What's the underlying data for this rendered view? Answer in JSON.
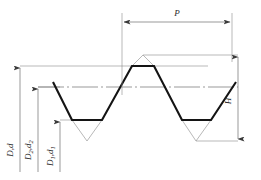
{
  "drawing": {
    "title": "ISO metric screw thread profile",
    "colors": {
      "profile_line": "#1a1a1a",
      "construction_line": "#8c8c8c",
      "dimension_line": "#6e6e6e",
      "text": "#2b2b2b",
      "background": "#ffffff"
    },
    "dimensions": [
      {
        "id": "pitch",
        "label": "P",
        "subscript": "",
        "orientation": "horizontal",
        "position": "top",
        "meaning": "pitch"
      },
      {
        "id": "height",
        "label": "H",
        "subscript": "",
        "orientation": "vertical",
        "position": "right",
        "meaning": "theoretical thread height"
      },
      {
        "id": "major-diameter",
        "label": "D,d",
        "subscript": "",
        "orientation": "vertical",
        "position": "left-outer",
        "meaning": "major diameter"
      },
      {
        "id": "pitch-diameter",
        "label": "D",
        "subscript": "2",
        "label2": ",d",
        "subscript2": "2",
        "orientation": "vertical",
        "position": "left-middle",
        "meaning": "pitch diameter"
      },
      {
        "id": "minor-diameter",
        "label": "D",
        "subscript": "1",
        "label2": ",d",
        "subscript2": "1",
        "orientation": "vertical",
        "position": "left-inner",
        "meaning": "minor diameter"
      }
    ],
    "geometry": {
      "sharp_crest_y": 55,
      "flat_crest_y": 66,
      "pitch_line_y": 87,
      "flat_root_y": 120,
      "sharp_root_y": 141,
      "pitch_left_x": 122,
      "pitch_right_x": 232
    }
  }
}
